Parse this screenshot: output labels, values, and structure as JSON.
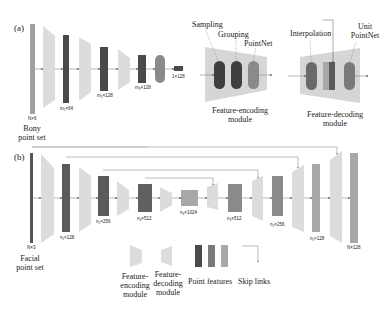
{
  "panel_a": {
    "label": "(a)",
    "input_label": "Bony\npoint set",
    "dims": [
      "N×6",
      "m₁×64",
      "m₂×128",
      "m₃×128",
      "1×128"
    ],
    "encoder_detail": {
      "title": "Feature-encoding\nmodule",
      "steps": [
        "Sampling",
        "Grouping",
        "PointNet"
      ]
    },
    "decoder_detail": {
      "title": "Feature-decoding\nmodule",
      "steps": [
        "Interpolation",
        "Unit\nPointNet"
      ]
    }
  },
  "panel_b": {
    "label": "(b)",
    "input_label": "Facial\npoint set",
    "dims": [
      "N×3",
      "n₁×128",
      "n₂×256",
      "n₃×512",
      "n₄×1024",
      "n₃×512",
      "n₂×256",
      "n₁×128",
      "N×128"
    ]
  },
  "legend": {
    "items": [
      "Feature-\nencoding\nmodule",
      "Feature-\ndecoding\nmodule",
      "Point features",
      "Skip links"
    ]
  },
  "colors": {
    "dark": "#4a4a4a",
    "mid": "#7a7a7a",
    "light": "#a8a8a8",
    "module": "#d8d8d8"
  }
}
